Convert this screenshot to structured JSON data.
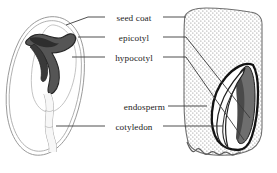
{
  "figure": {
    "kind": "botanical-diagram",
    "views": [
      {
        "id": "left-seed",
        "description": "whole seed, longitudinal view with curved embryo"
      },
      {
        "id": "right-seed",
        "description": "cut seed showing stippled endosperm and embryo"
      }
    ]
  },
  "labels": [
    {
      "id": "seed-coat",
      "text": "seed coat"
    },
    {
      "id": "epicotyl",
      "text": "epicotyl"
    },
    {
      "id": "hypocotyl",
      "text": "hypocotyl"
    },
    {
      "id": "endosperm",
      "text": "endosperm"
    },
    {
      "id": "cotyledon",
      "text": "cotyledon"
    }
  ],
  "colors": {
    "background": "#ffffff",
    "outline": "#1c1c1c",
    "leader_line": "#3a3a3a",
    "thin_outline": "#8a8a8a",
    "embryo_dark": "#4a4a4a",
    "embryo_darker": "#2e2e2e",
    "endosperm_stipple": "#6b6b6b",
    "text": "#1c1c1c"
  }
}
